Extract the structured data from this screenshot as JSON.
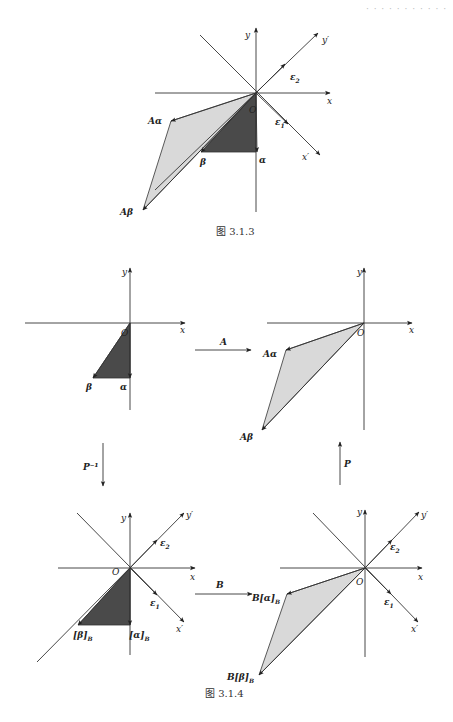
{
  "header": {
    "text": "· · ·  · ·  · · · · · ·"
  },
  "colors": {
    "ink": "#222222",
    "dark_fill": "#4a4a4a",
    "light_fill": "#d9d9d9",
    "axis": "#444444"
  },
  "figures": [
    {
      "id": "fig-3-1-3",
      "caption": "图 3.1.3",
      "caption_pos": [
        216,
        235
      ],
      "origin": [
        256,
        93
      ],
      "axes": {
        "x": {
          "from": [
            155,
            93
          ],
          "to": [
            330,
            93
          ],
          "label": "x",
          "label_pos": [
            327,
            104
          ]
        },
        "y": {
          "from": [
            256,
            212
          ],
          "to": [
            256,
            28
          ],
          "label": "y",
          "label_pos": [
            245,
            38
          ]
        },
        "x_prime": {
          "from": [
            200,
            35
          ],
          "to": [
            320,
            155
          ],
          "label": "x′",
          "label_pos": [
            302,
            160
          ]
        },
        "y_prime": {
          "from": [
            155,
            190
          ],
          "to": [
            318,
            33
          ],
          "label": "y′",
          "label_pos": [
            322,
            43
          ]
        }
      },
      "basis": [
        {
          "name": "ε2",
          "tip": [
            285,
            64
          ],
          "label_pos": [
            290,
            80
          ]
        },
        {
          "name": "ε1",
          "tip": [
            288,
            124
          ],
          "label_pos": [
            275,
            125
          ]
        }
      ],
      "dark_triangle": [
        [
          256,
          93
        ],
        [
          256,
          152
        ],
        [
          201,
          152
        ]
      ],
      "light_polygon": [
        [
          256,
          93
        ],
        [
          171,
          121
        ],
        [
          143,
          210
        ]
      ],
      "vectors": [
        {
          "name": "α",
          "tip": [
            257,
            152
          ],
          "label": "α",
          "label_pos": [
            259,
            163
          ],
          "bold": true
        },
        {
          "name": "β",
          "tip": [
            201,
            152
          ],
          "label": "β",
          "label_pos": [
            200,
            165
          ],
          "bold": true
        },
        {
          "name": "Aα",
          "tip": [
            171,
            121
          ],
          "label": "Aα",
          "label_pos": [
            148,
            124
          ],
          "bold": true
        },
        {
          "name": "Aβ",
          "tip": [
            143,
            210
          ],
          "label": "Aβ",
          "label_pos": [
            120,
            215
          ],
          "bold": true
        }
      ],
      "origin_label": {
        "text": "O",
        "pos": [
          249,
          113
        ]
      }
    }
  ],
  "figure_3_1_4": {
    "caption": "图 3.1.4",
    "caption_pos": [
      205,
      697
    ],
    "panels": [
      {
        "id": "panel-original",
        "origin": [
          130,
          323
        ],
        "axes": {
          "x": {
            "from": [
              25,
              323
            ],
            "to": [
              185,
              323
            ],
            "label": "x",
            "label_pos": [
              180,
              333
            ]
          },
          "y": {
            "from": [
              130,
              410
            ],
            "to": [
              130,
              268
            ],
            "label": "y",
            "label_pos": [
              122,
              275
            ]
          }
        },
        "dark_triangle": [
          [
            130,
            323
          ],
          [
            130,
            378
          ],
          [
            93,
            378
          ]
        ],
        "vectors": [
          {
            "label": "α",
            "tip": [
              130,
              378
            ],
            "label_pos": [
              120,
              390
            ]
          },
          {
            "label": "β",
            "tip": [
              93,
              378
            ],
            "label_pos": [
              86,
              390
            ]
          }
        ],
        "origin_label": {
          "text": "O",
          "pos": [
            121,
            336
          ]
        }
      },
      {
        "id": "panel-transformed",
        "origin": [
          364,
          323
        ],
        "axes": {
          "x": {
            "from": [
              267,
              323
            ],
            "to": [
              412,
              323
            ],
            "label": "x",
            "label_pos": [
              409,
              333
            ]
          },
          "y": {
            "from": [
              364,
              430
            ],
            "to": [
              364,
              268
            ],
            "label": "y",
            "label_pos": [
              357,
              275
            ]
          }
        },
        "light_polygon": [
          [
            364,
            323
          ],
          [
            286,
            350
          ],
          [
            262,
            430
          ]
        ],
        "vectors": [
          {
            "label": "Aα",
            "tip": [
              286,
              350
            ],
            "label_pos": [
              263,
              357
            ]
          },
          {
            "label": "Aβ",
            "tip": [
              262,
              430
            ],
            "label_pos": [
              240,
              440
            ]
          }
        ],
        "origin_label": {
          "text": "O",
          "pos": [
            357,
            336
          ]
        }
      },
      {
        "id": "panel-basis-B",
        "origin": [
          130,
          568
        ],
        "axes": {
          "x": {
            "from": [
              58,
              568
            ],
            "to": [
              195,
              568
            ],
            "label": "x",
            "label_pos": [
              190,
              580
            ]
          },
          "y": {
            "from": [
              130,
              655
            ],
            "to": [
              130,
              513
            ],
            "label": "y",
            "label_pos": [
              121,
              521
            ]
          },
          "x_prime": {
            "from": [
              77,
              513
            ],
            "to": [
              184,
              622
            ],
            "label": "x′",
            "label_pos": [
              176,
              632
            ]
          },
          "y_prime": {
            "from": [
              37,
              662
            ],
            "to": [
              184,
              513
            ],
            "label": "y′",
            "label_pos": [
              186,
              518
            ]
          }
        },
        "basis": [
          {
            "name": "ε2",
            "tip": [
              157,
              540
            ],
            "label_pos": [
              160,
              546
            ]
          },
          {
            "name": "ε1",
            "tip": [
              157,
              595
            ],
            "label_pos": [
              150,
              606
            ]
          }
        ],
        "dark_triangle": [
          [
            130,
            568
          ],
          [
            130,
            625
          ],
          [
            78,
            625
          ]
        ],
        "vectors": [
          {
            "label": "[α]",
            "sub": "B",
            "tip": [
              130,
              625
            ],
            "label_pos": [
              129,
              638
            ]
          },
          {
            "label": "[β]",
            "sub": "B",
            "tip": [
              78,
              625
            ],
            "label_pos": [
              73,
              638
            ]
          }
        ],
        "origin_label": {
          "text": "O",
          "pos": [
            112,
            575
          ]
        }
      },
      {
        "id": "panel-B-image",
        "origin": [
          365,
          568
        ],
        "axes": {
          "x": {
            "from": [
              280,
              568
            ],
            "to": [
              422,
              568
            ],
            "label": "x",
            "label_pos": [
              418,
              580
            ]
          },
          "y": {
            "from": [
              365,
              657
            ],
            "to": [
              365,
              510
            ],
            "label": "y",
            "label_pos": [
              357,
              515
            ]
          },
          "x_prime": {
            "from": [
              313,
              513
            ],
            "to": [
              418,
              622
            ],
            "label": "x′",
            "label_pos": [
              411,
              632
            ]
          },
          "y_prime": {
            "from": [
              365,
              568
            ],
            "to": [
              419,
              512
            ],
            "label": "y′",
            "label_pos": [
              421,
              518
            ]
          }
        },
        "basis": [
          {
            "name": "ε2",
            "tip": [
              392,
              540
            ],
            "label_pos": [
              390,
              550
            ]
          },
          {
            "name": "ε1",
            "tip": [
              391,
              594
            ],
            "label_pos": [
              384,
              605
            ]
          }
        ],
        "light_polygon": [
          [
            365,
            568
          ],
          [
            287,
            594
          ],
          [
            259,
            675
          ]
        ],
        "vectors": [
          {
            "label": "B[α]",
            "sub": "B",
            "tip": [
              287,
              594
            ],
            "label_pos": [
              252,
              601
            ]
          },
          {
            "label": "B[β]",
            "sub": "B",
            "tip": [
              259,
              675
            ],
            "label_pos": [
              227,
              680
            ]
          }
        ],
        "origin_label": {
          "text": "O",
          "pos": [
            356,
            585
          ]
        }
      }
    ],
    "maps": [
      {
        "label": "A",
        "from": [
          195,
          350
        ],
        "to": [
          251,
          350
        ],
        "label_pos": [
          220,
          345
        ]
      },
      {
        "label": "P⁻¹",
        "from": [
          103,
          443
        ],
        "to": [
          103,
          486
        ],
        "label_pos": [
          83,
          470
        ]
      },
      {
        "label": "P",
        "from": [
          340,
          485
        ],
        "to": [
          340,
          442
        ],
        "label_pos": [
          344,
          467
        ]
      },
      {
        "label": "B",
        "from": [
          195,
          594
        ],
        "to": [
          252,
          594
        ],
        "label_pos": [
          216,
          588
        ]
      }
    ]
  }
}
